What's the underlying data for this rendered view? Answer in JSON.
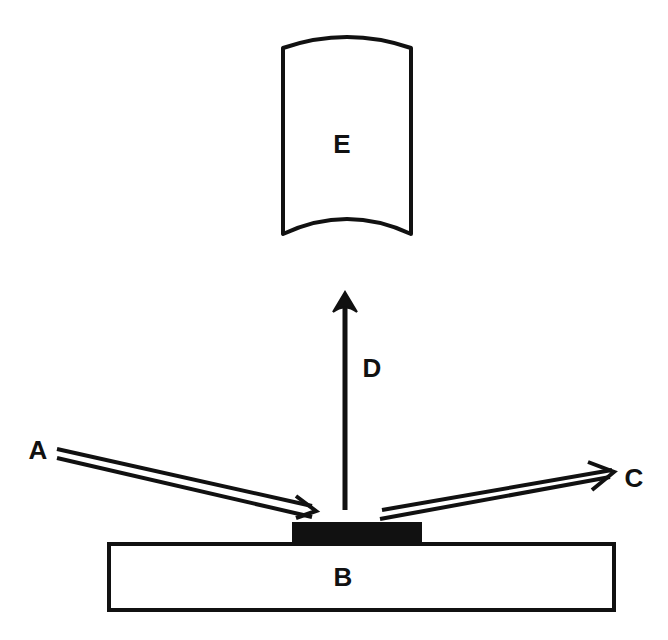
{
  "diagram": {
    "type": "schematic",
    "labels": {
      "A": "A",
      "B": "B",
      "C": "C",
      "D": "D",
      "E": "E"
    },
    "components": [
      {
        "id": "A",
        "description": "incident beam (double-line arrow) striking the sample at a grazing angle"
      },
      {
        "id": "B",
        "description": "substrate (rectangular slab)"
      },
      {
        "id": "C",
        "description": "reflected / transmitted beam (double-line arrow) leaving the sample"
      },
      {
        "id": "D",
        "description": "upward emission arrow from sample toward detector"
      },
      {
        "id": "E",
        "description": "detector (rectangle with curved top and bottom edges)"
      },
      {
        "id": "sample",
        "description": "dark thin layer on top of substrate"
      }
    ],
    "colors": {
      "ink": "#111111",
      "background": "#ffffff"
    }
  }
}
